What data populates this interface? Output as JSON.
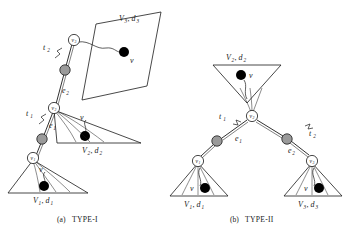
{
  "figure": {
    "panels": [
      {
        "id": "panel-a",
        "caption_prefix": "(a)",
        "caption_label": "TYPE-I",
        "regions": [
          {
            "name": "region-v3",
            "V": "V",
            "Vsub": "3",
            "comma": ", ",
            "d": "d",
            "dsub": "3",
            "vertex_label": "v"
          },
          {
            "name": "region-v2",
            "V": "V",
            "Vsub": "2",
            "comma": ", ",
            "d": "d",
            "dsub": "2",
            "vertex_label": "v"
          },
          {
            "name": "region-v1",
            "V": "V",
            "Vsub": "1",
            "comma": ", ",
            "d": "d",
            "dsub": "1",
            "vertex_label": "v"
          }
        ],
        "edge_labels": [
          {
            "name": "edge-label-t2",
            "base": "t",
            "sub": "2"
          },
          {
            "name": "edge-label-e2",
            "base": "e",
            "sub": "2"
          },
          {
            "name": "edge-label-t1",
            "base": "t",
            "sub": "1"
          },
          {
            "name": "edge-label-e1",
            "base": "e",
            "sub": "1"
          }
        ],
        "nodes": [
          {
            "name": "node-v3",
            "base": "v",
            "sub": "3",
            "filled": false
          },
          {
            "name": "node-mid-upper",
            "base": "",
            "sub": "",
            "filled": true
          },
          {
            "name": "node-v2",
            "base": "v",
            "sub": "2",
            "filled": false
          },
          {
            "name": "node-mid-lower",
            "base": "",
            "sub": "",
            "filled": true
          },
          {
            "name": "node-v1",
            "base": "v",
            "sub": "1",
            "filled": false
          }
        ]
      },
      {
        "id": "panel-b",
        "caption_prefix": "(b)",
        "caption_label": "TYPE-II",
        "regions": [
          {
            "name": "region-v2",
            "V": "V",
            "Vsub": "2",
            "comma": ", ",
            "d": "d",
            "dsub": "2",
            "vertex_label": "v"
          },
          {
            "name": "region-v1",
            "V": "V",
            "Vsub": "1",
            "comma": ", ",
            "d": "d",
            "dsub": "1",
            "vertex_label": "v"
          },
          {
            "name": "region-v3",
            "V": "V",
            "Vsub": "3",
            "comma": ", ",
            "d": "d",
            "dsub": "3",
            "vertex_label": "v"
          }
        ],
        "edge_labels": [
          {
            "name": "edge-label-t1",
            "base": "t",
            "sub": "1"
          },
          {
            "name": "edge-label-e1",
            "base": "e",
            "sub": "1"
          },
          {
            "name": "edge-label-t2",
            "base": "t",
            "sub": "2"
          },
          {
            "name": "edge-label-e2",
            "base": "e",
            "sub": "2"
          }
        ],
        "nodes": [
          {
            "name": "node-v2",
            "base": "v",
            "sub": "2",
            "filled": false
          },
          {
            "name": "node-left-mid",
            "base": "",
            "sub": "",
            "filled": true
          },
          {
            "name": "node-v1",
            "base": "v",
            "sub": "1",
            "filled": false
          },
          {
            "name": "node-right-mid",
            "base": "",
            "sub": "",
            "filled": true
          },
          {
            "name": "node-v3",
            "base": "v",
            "sub": "3",
            "filled": false
          }
        ]
      }
    ],
    "colors": {
      "stroke": "#1a1a1a",
      "node_open_fill": "#ffffff",
      "node_shaded_fill": "#9a9a9a",
      "vertex_dot_fill": "#000000",
      "background": "#ffffff"
    }
  }
}
